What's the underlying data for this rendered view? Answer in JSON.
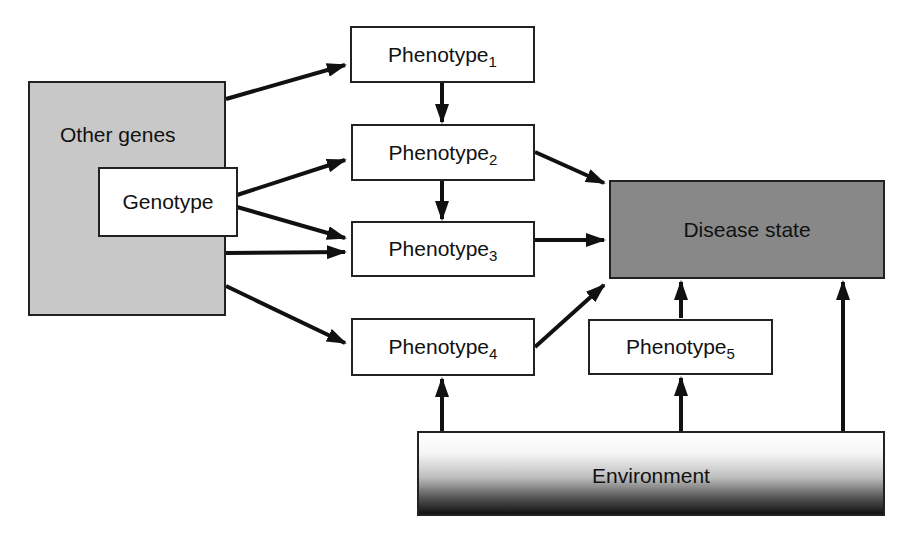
{
  "diagram": {
    "nodes": {
      "other_genes": {
        "label": "Other genes",
        "fill": "#c8c8c8"
      },
      "genotype": {
        "label": "Genotype",
        "fill": "#ffffff"
      },
      "phenotype1": {
        "label": "Phenotype",
        "sub": "1"
      },
      "phenotype2": {
        "label": "Phenotype",
        "sub": "2"
      },
      "phenotype3": {
        "label": "Phenotype",
        "sub": "3"
      },
      "phenotype4": {
        "label": "Phenotype",
        "sub": "4"
      },
      "phenotype5": {
        "label": "Phenotype",
        "sub": "5"
      },
      "disease_state": {
        "label": "Disease state",
        "fill": "#888888"
      },
      "environment": {
        "label": "Environment",
        "fill": "gradient white-to-black"
      }
    },
    "edges": [
      {
        "from": "other_genes",
        "to": "phenotype1"
      },
      {
        "from": "genotype",
        "to": "phenotype2"
      },
      {
        "from": "genotype",
        "to": "phenotype3"
      },
      {
        "from": "other_genes",
        "to": "phenotype3"
      },
      {
        "from": "other_genes",
        "to": "phenotype4"
      },
      {
        "from": "phenotype1",
        "to": "phenotype2"
      },
      {
        "from": "phenotype2",
        "to": "phenotype3"
      },
      {
        "from": "phenotype2",
        "to": "disease_state"
      },
      {
        "from": "phenotype3",
        "to": "disease_state"
      },
      {
        "from": "phenotype4",
        "to": "disease_state"
      },
      {
        "from": "phenotype5",
        "to": "disease_state"
      },
      {
        "from": "environment",
        "to": "phenotype4"
      },
      {
        "from": "environment",
        "to": "phenotype5"
      },
      {
        "from": "environment",
        "to": "disease_state"
      }
    ]
  }
}
